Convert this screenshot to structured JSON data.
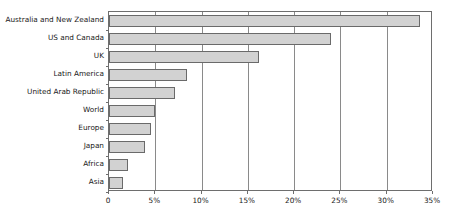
{
  "chart_data": {
    "type": "bar",
    "orientation": "horizontal",
    "title": "",
    "subtitle": "",
    "xlabel": "",
    "ylabel": "",
    "categories": [
      "Australia and New Zealand",
      "US and Canada",
      "UK",
      "Latin America",
      "United Arab Republic",
      "World",
      "Europe",
      "Japan",
      "Africa",
      "Asia"
    ],
    "values": [
      33.6,
      24.0,
      16.2,
      8.4,
      7.1,
      5.0,
      4.5,
      3.9,
      2.0,
      1.5
    ],
    "value_suffix": "%",
    "xlim": [
      0,
      35
    ],
    "xticks": [
      0,
      5,
      10,
      15,
      20,
      25,
      30,
      35
    ],
    "xtick_labels": [
      "0",
      "5%",
      "10%",
      "15%",
      "20%",
      "25%",
      "30%",
      "35%"
    ],
    "grid": true,
    "grid_axis": "x",
    "legend": false,
    "series": [
      {
        "name": "",
        "values": [
          33.6,
          24.0,
          16.2,
          8.4,
          7.1,
          5.0,
          4.5,
          3.9,
          2.0,
          1.5
        ]
      }
    ],
    "colors": {
      "bar_fill": "#d2d2d2",
      "bar_border": "#6a6a6a",
      "axis": "#6e6e6e",
      "gridline": "#8a8a8a",
      "text": "#1a1a1a",
      "background": "#ffffff"
    }
  }
}
